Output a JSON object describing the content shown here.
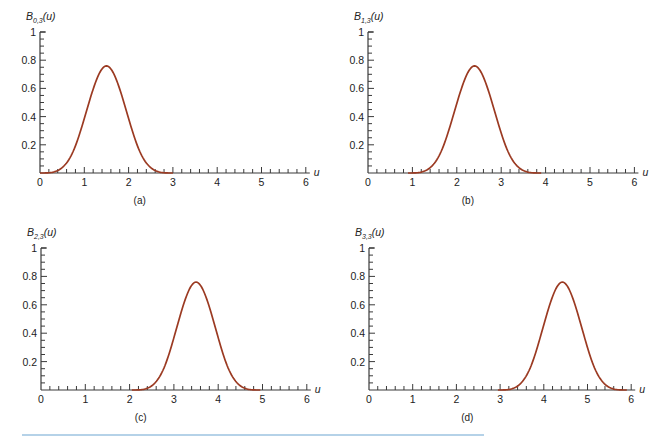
{
  "chart_data": [
    {
      "type": "line",
      "panel": "a",
      "caption": "(a)",
      "ylabel_main": "B",
      "ylabel_sub": "0,3",
      "ylabel_arg": "(u)",
      "xlabel": "u",
      "xticks": [
        0,
        1,
        2,
        3,
        4,
        5,
        6
      ],
      "yticks": [
        0.2,
        0.4,
        0.6,
        0.8,
        1
      ],
      "xlim": [
        0,
        6
      ],
      "ylim": [
        0,
        1
      ],
      "series": [
        {
          "name": "B0,3(u)",
          "x": [
            0,
            0.5,
            1.0,
            1.2,
            1.45,
            1.7,
            2.0,
            2.5,
            3.0
          ],
          "values": [
            0,
            0.06,
            0.38,
            0.6,
            0.76,
            0.62,
            0.38,
            0.06,
            0
          ]
        }
      ]
    },
    {
      "type": "line",
      "panel": "b",
      "caption": "(b)",
      "ylabel_main": "B",
      "ylabel_sub": "1,3",
      "ylabel_arg": "(u)",
      "xlabel": "u",
      "xticks": [
        0,
        1,
        2,
        3,
        4,
        5,
        6
      ],
      "yticks": [
        0.2,
        0.4,
        0.6,
        0.8,
        1
      ],
      "xlim": [
        0,
        6
      ],
      "ylim": [
        0,
        1
      ],
      "series": [
        {
          "name": "B1,3(u)",
          "x": [
            0.9,
            1.4,
            1.9,
            2.15,
            2.4,
            2.65,
            2.9,
            3.4,
            3.9
          ],
          "values": [
            0,
            0.06,
            0.38,
            0.6,
            0.76,
            0.62,
            0.38,
            0.06,
            0
          ]
        }
      ]
    },
    {
      "type": "line",
      "panel": "c",
      "caption": "(c)",
      "ylabel_main": "B",
      "ylabel_sub": "2,3",
      "ylabel_arg": "(u)",
      "xlabel": "u",
      "xticks": [
        0,
        1,
        2,
        3,
        4,
        5,
        6
      ],
      "yticks": [
        0.2,
        0.4,
        0.6,
        0.8,
        1
      ],
      "xlim": [
        0,
        6
      ],
      "ylim": [
        0,
        1
      ],
      "series": [
        {
          "name": "B2,3(u)",
          "x": [
            2.05,
            2.55,
            3.05,
            3.25,
            3.5,
            3.75,
            4.0,
            4.5,
            4.95
          ],
          "values": [
            0,
            0.06,
            0.38,
            0.6,
            0.76,
            0.62,
            0.38,
            0.06,
            0
          ]
        }
      ]
    },
    {
      "type": "line",
      "panel": "d",
      "caption": "(d)",
      "ylabel_main": "B",
      "ylabel_sub": "3,3",
      "ylabel_arg": "(u)",
      "xlabel": "u",
      "xticks": [
        0,
        1,
        2,
        3,
        4,
        5,
        6
      ],
      "yticks": [
        0.2,
        0.4,
        0.6,
        0.8,
        1
      ],
      "xlim": [
        0,
        6
      ],
      "ylim": [
        0,
        1
      ],
      "series": [
        {
          "name": "B3,3(u)",
          "x": [
            2.95,
            3.45,
            3.95,
            4.15,
            4.4,
            4.65,
            4.9,
            5.4,
            5.9
          ],
          "values": [
            0,
            0.06,
            0.38,
            0.6,
            0.76,
            0.62,
            0.38,
            0.06,
            0
          ]
        }
      ]
    }
  ],
  "colors": {
    "curve": "#9b3a22",
    "axis": "#3a3a3a",
    "rule": "#9cc3e0"
  }
}
